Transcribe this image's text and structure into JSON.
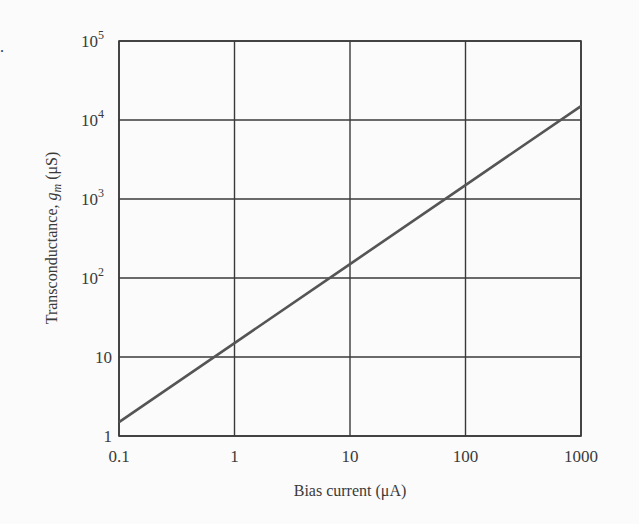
{
  "chart_data": {
    "type": "line",
    "title": "",
    "xlabel": "Bias current (μA)",
    "ylabel": "Transconductance, g_m (μS)",
    "ylabel_parts": {
      "prefix": "Transconductance, ",
      "symbol": "g",
      "subscript": "m",
      "unit": " (μS)"
    },
    "xscale": "log",
    "yscale": "log",
    "xlim": [
      0.1,
      1000
    ],
    "ylim": [
      1,
      100000
    ],
    "x_ticks": [
      "0.1",
      "1",
      "10",
      "100",
      "1000"
    ],
    "y_ticks": [
      {
        "base": "1",
        "exp": ""
      },
      {
        "base": "10",
        "exp": ""
      },
      {
        "base": "10",
        "exp": "2"
      },
      {
        "base": "10",
        "exp": "3"
      },
      {
        "base": "10",
        "exp": "4"
      },
      {
        "base": "10",
        "exp": "5"
      }
    ],
    "grid": true,
    "legend": null,
    "series": [
      {
        "name": "g_m vs bias current",
        "x": [
          0.1,
          1,
          10,
          100,
          1000
        ],
        "y": [
          1.5,
          15,
          150,
          1500,
          15000
        ]
      }
    ],
    "colors": {
      "line": "#555555",
      "grid": "#3a3a3a",
      "text": "#3a3a3a"
    }
  }
}
